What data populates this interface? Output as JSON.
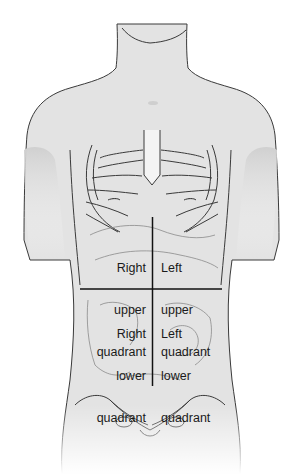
{
  "figure": {
    "colors": {
      "skin": "#e3e3e3",
      "skin_shadow": "#c9c9c9",
      "outline": "#3a3a3a",
      "bone": "#f2f2f2",
      "organ": "#d2d2d2",
      "divider": "#111111",
      "text": "#1a1a1a"
    }
  },
  "quadrants": {
    "right_upper": {
      "lines": [
        "Right",
        "upper",
        "quadrant"
      ]
    },
    "left_upper": {
      "lines": [
        "Left",
        "upper",
        "quadrant"
      ]
    },
    "right_lower": {
      "lines": [
        "Right",
        "lower",
        "quadrant"
      ]
    },
    "left_lower": {
      "lines": [
        "Left",
        "lower",
        "quadrant"
      ]
    }
  }
}
